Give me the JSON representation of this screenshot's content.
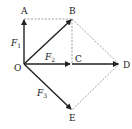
{
  "diagram": {
    "type": "force-vector-parallelogram",
    "points": {
      "O": {
        "label": "O",
        "x": 24,
        "y": 64
      },
      "A": {
        "label": "A",
        "x": 24,
        "y": 19
      },
      "B": {
        "label": "B",
        "x": 72,
        "y": 19
      },
      "C": {
        "label": "C",
        "x": 72,
        "y": 64
      },
      "D": {
        "label": "D",
        "x": 119,
        "y": 64
      },
      "E": {
        "label": "E",
        "x": 72,
        "y": 110
      }
    },
    "vectors": [
      {
        "from": "O",
        "to": "A",
        "label": "F",
        "sub": "1"
      },
      {
        "from": "O",
        "to": "C",
        "label": "F",
        "sub": "2"
      },
      {
        "from": "O",
        "to": "E",
        "label": "F",
        "sub": "3"
      },
      {
        "from": "O",
        "to": "B",
        "label": ""
      },
      {
        "from": "C",
        "to": "D",
        "label": ""
      }
    ],
    "dashed": [
      [
        "A",
        "B"
      ],
      [
        "B",
        "C"
      ],
      [
        "B",
        "D"
      ],
      [
        "D",
        "E"
      ]
    ],
    "colors": {
      "line": "#222222",
      "dash": "#777777"
    }
  }
}
